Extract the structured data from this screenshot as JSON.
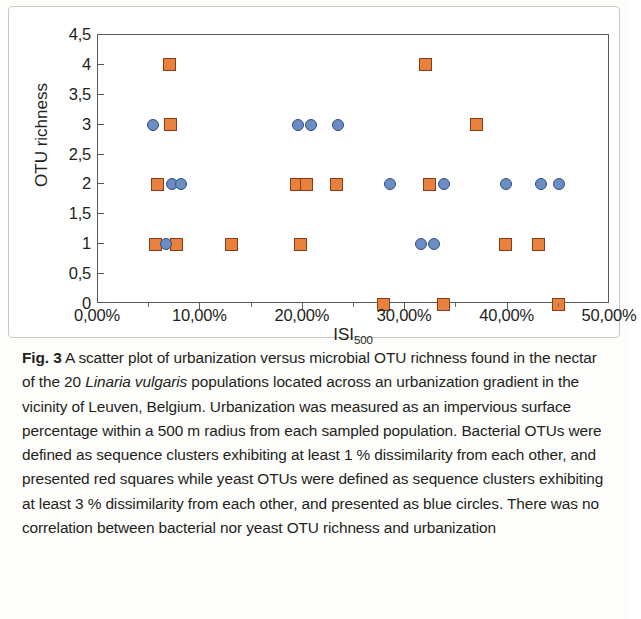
{
  "figure": {
    "label": "Fig. 3",
    "caption_parts": {
      "p1": " A scatter plot of urbanization versus microbial OTU richness found in the nectar of the 20 ",
      "species": "Linaria vulgaris",
      "p2": " populations located across an urbanization gradient in the vicinity of Leuven, Belgium. Urbanization was measured as an impervious surface percentage within a 500 m radius from each sampled population. Bacterial OTUs were defined as sequence clusters exhibiting at least 1 % dissimilarity from each other, and presented red squares while yeast OTUs were defined as sequence clusters exhibiting at least 3 % dissimilarity from each other, and presented as blue circles. There was no correlation between bacterial nor yeast OTU richness and urbanization"
    }
  },
  "axis_titles": {
    "x_main": "ISI",
    "x_sub": "500",
    "y": "OTU richness"
  },
  "chart_data": {
    "type": "scatter",
    "title": "",
    "xlabel": "ISI500",
    "ylabel": "OTU richness",
    "xlim": [
      0,
      50
    ],
    "ylim": [
      0,
      4.5
    ],
    "xtick_values": [
      0,
      10,
      20,
      30,
      40,
      50
    ],
    "xtick_labels": [
      "0,00%",
      "10,00%",
      "20,00%",
      "30,00%",
      "40,00%",
      "50,00%"
    ],
    "ytick_values": [
      0,
      0.5,
      1,
      1.5,
      2,
      2.5,
      3,
      3.5,
      4,
      4.5
    ],
    "ytick_labels": [
      "0",
      "0,5",
      "1",
      "1,5",
      "2",
      "2,5",
      "3",
      "3,5",
      "4",
      "4,5"
    ],
    "grid": false,
    "legend": "none",
    "marker_colors": {
      "bacterial_square_fill": "#e8813c",
      "bacterial_square_edge": "#8c3b1a",
      "yeast_circle_fill": "#6b8dc4",
      "yeast_circle_edge": "#2f4f82"
    },
    "series": [
      {
        "name": "Bacterial OTU richness",
        "marker": "square",
        "color": "#e8813c",
        "points": [
          [
            7.0,
            4
          ],
          [
            32.0,
            4
          ],
          [
            7.1,
            3
          ],
          [
            37.0,
            3
          ],
          [
            5.8,
            2
          ],
          [
            19.4,
            2
          ],
          [
            20.4,
            2
          ],
          [
            23.3,
            2
          ],
          [
            32.4,
            2
          ],
          [
            5.6,
            1
          ],
          [
            7.7,
            1
          ],
          [
            13.0,
            1
          ],
          [
            19.8,
            1
          ],
          [
            39.8,
            1
          ],
          [
            43.0,
            1
          ],
          [
            27.9,
            0
          ],
          [
            33.7,
            0
          ],
          [
            45.0,
            0
          ]
        ]
      },
      {
        "name": "Yeast OTU richness",
        "marker": "circle",
        "color": "#6b8dc4",
        "points": [
          [
            5.4,
            3
          ],
          [
            19.5,
            3
          ],
          [
            20.8,
            3
          ],
          [
            23.4,
            3
          ],
          [
            7.2,
            2
          ],
          [
            8.1,
            2
          ],
          [
            28.5,
            2
          ],
          [
            33.8,
            2
          ],
          [
            39.8,
            2
          ],
          [
            43.3,
            2
          ],
          [
            45.0,
            2
          ],
          [
            6.6,
            1
          ],
          [
            31.5,
            1
          ],
          [
            32.8,
            1
          ]
        ]
      }
    ]
  }
}
